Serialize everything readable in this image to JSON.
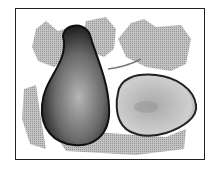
{
  "image": {
    "subject": "illustration of a whole pear and a halved pear with leaves",
    "style": "grayscale halftone",
    "frame_color": "#222222",
    "background": "#ffffff"
  }
}
